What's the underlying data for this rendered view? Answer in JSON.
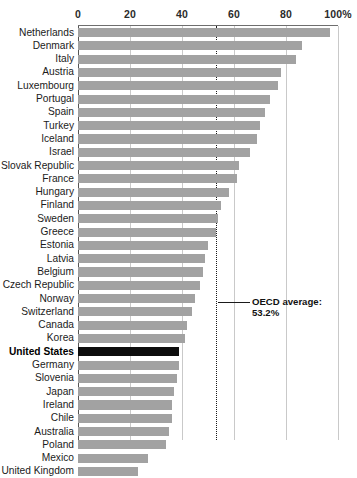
{
  "chart_data": {
    "type": "bar",
    "orientation": "horizontal",
    "title": "",
    "xlabel": "",
    "ylabel": "",
    "xlim": [
      0,
      100
    ],
    "grid": true,
    "legend": null,
    "tick_labels": [
      "0",
      "20",
      "40",
      "60",
      "80",
      "100%"
    ],
    "tick_values": [
      0,
      20,
      40,
      60,
      80,
      100
    ],
    "categories": [
      "Netherlands",
      "Denmark",
      "Italy",
      "Austria",
      "Luxembourg",
      "Portugal",
      "Spain",
      "Turkey",
      "Iceland",
      "Israel",
      "Slovak Republic",
      "France",
      "Hungary",
      "Finland",
      "Sweden",
      "Greece",
      "Estonia",
      "Latvia",
      "Belgium",
      "Czech Republic",
      "Norway",
      "Switzerland",
      "Canada",
      "Korea",
      "United States",
      "Germany",
      "Slovenia",
      "Japan",
      "Ireland",
      "Chile",
      "Australia",
      "Poland",
      "Mexico",
      "United Kingdom"
    ],
    "values": [
      97,
      86,
      84,
      78,
      77,
      74,
      72,
      70,
      69,
      66,
      62,
      61,
      58,
      55,
      54,
      53,
      50,
      49,
      48,
      47,
      45,
      44,
      42,
      41,
      39,
      39,
      38,
      37,
      36,
      36,
      35,
      34,
      27,
      23
    ],
    "highlight_category": "United States",
    "highlight_color": "#0d0d0d",
    "bar_color": "#a2a2a2",
    "reference_line": {
      "value": 53.2,
      "label_line1": "OECD average:",
      "label_line2": "53.2%",
      "style": "dotted"
    }
  },
  "annotation": {
    "line1": "OECD average:",
    "line2": "53.2%"
  }
}
